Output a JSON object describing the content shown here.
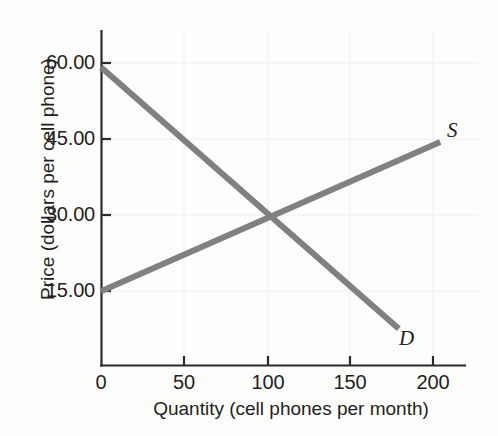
{
  "chart_data": {
    "type": "line",
    "title": "",
    "subtitle": "",
    "xlabel": "Quantity (cell phones per month)",
    "ylabel": "Price (dollars per cell phone)",
    "xlim": [
      0,
      220
    ],
    "ylim": [
      0,
      67.5
    ],
    "xticks": [
      0,
      50,
      100,
      150,
      200
    ],
    "xtick_labels": [
      "0",
      "50",
      "100",
      "150",
      "200"
    ],
    "yticks": [
      15,
      30,
      45,
      60
    ],
    "ytick_labels": [
      "15.00",
      "30.00",
      "45.00",
      "60.00"
    ],
    "grid": "faint-horizontal-and-vertical",
    "legend": "inline-curve-labels",
    "line_color": "#808080",
    "axis_color": "#2b2b2b",
    "gridline_color": "#eeeeee",
    "line_width_px": 6,
    "series": [
      {
        "name": "D",
        "label": "D",
        "description": "Demand curve",
        "points": [
          {
            "x": 0,
            "y": 60.0
          },
          {
            "x": 180,
            "y": 7.5
          }
        ],
        "label_position": {
          "x": 183,
          "y": 6.0
        }
      },
      {
        "name": "S",
        "label": "S",
        "description": "Supply curve",
        "points": [
          {
            "x": 0,
            "y": 15.0
          },
          {
            "x": 205,
            "y": 45.0
          }
        ],
        "label_position": {
          "x": 211,
          "y": 47.5
        }
      }
    ],
    "annotations": [
      {
        "name": "equilibrium",
        "x": 100,
        "y": 30.0,
        "text": ""
      }
    ]
  },
  "axes": {
    "y_title": "Price (dollars per cell phone)",
    "x_title": "Quantity (cell phones per month)",
    "y_tick_labels": [
      "60.00",
      "45.00",
      "30.00",
      "15.00"
    ],
    "x_tick_labels": [
      "0",
      "50",
      "100",
      "150",
      "200"
    ]
  },
  "curve_labels": {
    "supply": "S",
    "demand": "D"
  }
}
